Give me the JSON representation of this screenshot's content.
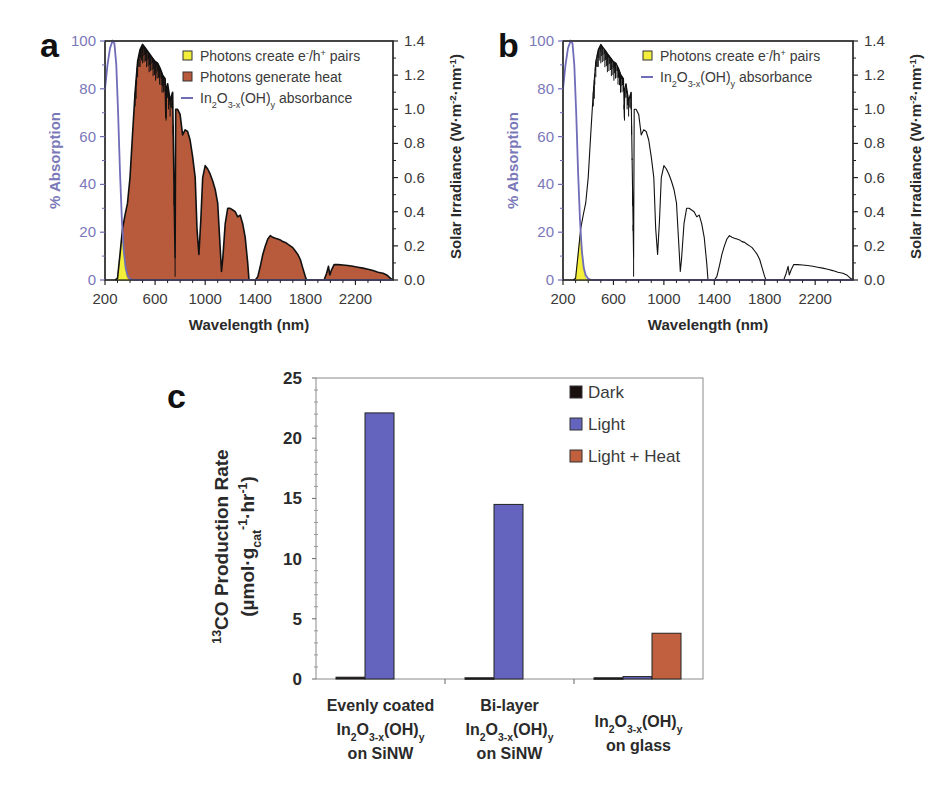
{
  "chart_data": [
    {
      "panel": "a",
      "type": "area",
      "xlabel": "Wavelength (nm)",
      "ylabel_left": "% Absorption",
      "ylabel_right": "Solar Irradiance (W·m-2·nm-1)",
      "xlim": [
        200,
        2500
      ],
      "ylim_left": [
        0,
        100
      ],
      "ylim_right": [
        0.0,
        1.4
      ],
      "xticks": [
        200,
        600,
        1000,
        1400,
        1800,
        2200
      ],
      "yticks_left": [
        0,
        20,
        40,
        60,
        80,
        100
      ],
      "yticks_right": [
        "0.0",
        "0.2",
        "0.4",
        "0.6",
        "0.8",
        "1.0",
        "1.2",
        "1.4"
      ],
      "legend": [
        {
          "label": "Photons create e-/h+ pairs",
          "type": "box",
          "color": "#f2ee3a"
        },
        {
          "label": "Photons generate heat",
          "type": "box",
          "color": "#b85a3c"
        },
        {
          "label": "In2O3-x(OH)y absorbance",
          "type": "line",
          "color": "#6f6cb8"
        }
      ],
      "show_heat_fill": true
    },
    {
      "panel": "b",
      "type": "line",
      "xlabel": "Wavelength (nm)",
      "ylabel_left": "% Absorption",
      "ylabel_right": "Solar Irradiance (W·m-2·nm-1)",
      "xlim": [
        200,
        2500
      ],
      "ylim_left": [
        0,
        100
      ],
      "ylim_right": [
        0.0,
        1.4
      ],
      "xticks": [
        200,
        600,
        1000,
        1400,
        1800,
        2200
      ],
      "yticks_left": [
        0,
        20,
        40,
        60,
        80,
        100
      ],
      "yticks_right": [
        "0.0",
        "0.2",
        "0.4",
        "0.6",
        "0.8",
        "1.0",
        "1.2",
        "1.4"
      ],
      "legend": [
        {
          "label": "Photons create e-/h+ pairs",
          "type": "box",
          "color": "#f2ee3a"
        },
        {
          "label": "In2O3-x(OH)y absorbance",
          "type": "line",
          "color": "#6f6cb8"
        }
      ],
      "show_heat_fill": false
    },
    {
      "panel": "c",
      "type": "bar",
      "title": "",
      "ylabel": "13CO Production Rate (µmol·gcat-1·hr-1)",
      "ylim": [
        0,
        25
      ],
      "yticks": [
        0,
        5,
        10,
        15,
        20,
        25
      ],
      "categories": [
        "Evenly coated In2O3-x(OH)y on SiNW",
        "Bi-layer In2O3-x(OH)y on SiNW",
        "In2O3-x(OH)y on glass"
      ],
      "series": [
        {
          "name": "Dark",
          "color": "#1a1010",
          "values": [
            0.15,
            0.1,
            0.1
          ]
        },
        {
          "name": "Light",
          "color": "#6464be",
          "values": [
            22.1,
            14.5,
            0.2
          ]
        },
        {
          "name": "Light + Heat",
          "color": "#c0603e",
          "values": [
            null,
            null,
            3.8
          ]
        }
      ],
      "legend_position": "upper right"
    }
  ],
  "spectrum": {
    "absorbance_nm_pct": [
      [
        200,
        80
      ],
      [
        220,
        90
      ],
      [
        240,
        97
      ],
      [
        260,
        100
      ],
      [
        275,
        99
      ],
      [
        290,
        90
      ],
      [
        305,
        70
      ],
      [
        320,
        45
      ],
      [
        335,
        25
      ],
      [
        350,
        12
      ],
      [
        365,
        5
      ],
      [
        380,
        2
      ],
      [
        400,
        0.5
      ],
      [
        430,
        0
      ],
      [
        2500,
        0
      ]
    ],
    "irradiance_nm_w": [
      [
        280,
        0
      ],
      [
        300,
        0.01
      ],
      [
        320,
        0.15
      ],
      [
        340,
        0.3
      ],
      [
        360,
        0.38
      ],
      [
        380,
        0.45
      ],
      [
        400,
        0.6
      ],
      [
        420,
        0.85
      ],
      [
        440,
        1.1
      ],
      [
        460,
        1.28
      ],
      [
        480,
        1.35
      ],
      [
        500,
        1.38
      ],
      [
        520,
        1.36
      ],
      [
        540,
        1.34
      ],
      [
        560,
        1.32
      ],
      [
        580,
        1.3
      ],
      [
        600,
        1.28
      ],
      [
        620,
        1.27
      ],
      [
        640,
        1.24
      ],
      [
        660,
        1.2
      ],
      [
        680,
        1.18
      ],
      [
        686,
        0.95
      ],
      [
        690,
        1.12
      ],
      [
        700,
        1.15
      ],
      [
        720,
        1.05
      ],
      [
        740,
        1.1
      ],
      [
        760,
        0.13
      ],
      [
        765,
        1.0
      ],
      [
        780,
        1.0
      ],
      [
        800,
        0.97
      ],
      [
        820,
        0.85
      ],
      [
        840,
        0.88
      ],
      [
        860,
        0.87
      ],
      [
        880,
        0.82
      ],
      [
        900,
        0.72
      ],
      [
        920,
        0.6
      ],
      [
        935,
        0.3
      ],
      [
        950,
        0.15
      ],
      [
        965,
        0.35
      ],
      [
        980,
        0.6
      ],
      [
        1000,
        0.67
      ],
      [
        1020,
        0.65
      ],
      [
        1040,
        0.62
      ],
      [
        1060,
        0.58
      ],
      [
        1080,
        0.53
      ],
      [
        1100,
        0.45
      ],
      [
        1115,
        0.25
      ],
      [
        1130,
        0.05
      ],
      [
        1140,
        0.12
      ],
      [
        1160,
        0.33
      ],
      [
        1180,
        0.42
      ],
      [
        1200,
        0.42
      ],
      [
        1220,
        0.41
      ],
      [
        1240,
        0.4
      ],
      [
        1260,
        0.37
      ],
      [
        1280,
        0.38
      ],
      [
        1300,
        0.33
      ],
      [
        1320,
        0.25
      ],
      [
        1340,
        0.1
      ],
      [
        1350,
        0.0
      ],
      [
        1400,
        0.0
      ],
      [
        1420,
        0.02
      ],
      [
        1440,
        0.08
      ],
      [
        1460,
        0.15
      ],
      [
        1480,
        0.2
      ],
      [
        1500,
        0.24
      ],
      [
        1520,
        0.26
      ],
      [
        1540,
        0.25
      ],
      [
        1560,
        0.245
      ],
      [
        1580,
        0.24
      ],
      [
        1600,
        0.235
      ],
      [
        1620,
        0.225
      ],
      [
        1640,
        0.22
      ],
      [
        1660,
        0.21
      ],
      [
        1680,
        0.2
      ],
      [
        1700,
        0.19
      ],
      [
        1720,
        0.17
      ],
      [
        1740,
        0.15
      ],
      [
        1760,
        0.12
      ],
      [
        1780,
        0.07
      ],
      [
        1800,
        0.02
      ],
      [
        1810,
        0.0
      ],
      [
        1950,
        0.0
      ],
      [
        1970,
        0.04
      ],
      [
        1985,
        0.08
      ],
      [
        1995,
        0.03
      ],
      [
        2010,
        0.06
      ],
      [
        2030,
        0.09
      ],
      [
        2060,
        0.09
      ],
      [
        2100,
        0.088
      ],
      [
        2140,
        0.085
      ],
      [
        2180,
        0.08
      ],
      [
        2220,
        0.075
      ],
      [
        2260,
        0.07
      ],
      [
        2300,
        0.063
      ],
      [
        2340,
        0.055
      ],
      [
        2380,
        0.045
      ],
      [
        2420,
        0.04
      ],
      [
        2450,
        0.03
      ],
      [
        2480,
        0.01
      ],
      [
        2500,
        0.0
      ]
    ]
  }
}
